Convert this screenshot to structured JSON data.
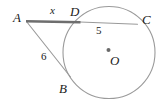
{
  "figure": {
    "kind": "geometry-diagram",
    "background_color": "#ffffff",
    "stroke_color": "#8c8c8c",
    "emphasis_stroke_color": "#6e6e6e",
    "label_color": "#1b1b1b"
  },
  "circle": {
    "center_label": "O",
    "center_x": 109,
    "center_y": 52.5,
    "radius": 46,
    "center_dot_radius": 2.0
  },
  "points": [
    {
      "name": "A",
      "label": "A",
      "x": 26,
      "y": 21,
      "position": "external-left"
    },
    {
      "name": "D",
      "label": "D",
      "x": 80,
      "y": 22,
      "position": "on-circle-top-left"
    },
    {
      "name": "C",
      "label": "C",
      "x": 137,
      "y": 24,
      "position": "on-circle-top-right"
    },
    {
      "name": "B",
      "label": "B",
      "x": 70,
      "y": 76,
      "position": "on-circle-lower-left"
    },
    {
      "name": "O",
      "label": "O",
      "x": 109,
      "y": 52.5,
      "position": "center"
    }
  ],
  "segments": [
    {
      "name": "AD",
      "label": "x",
      "from": "A",
      "to": "D",
      "emphasis": true,
      "style": "thick"
    },
    {
      "name": "DC",
      "label": "5",
      "from": "D",
      "to": "C",
      "emphasis": false,
      "style": "thin"
    },
    {
      "name": "AB",
      "label": "6",
      "from": "A",
      "to": "B",
      "emphasis": false,
      "style": "thin"
    }
  ],
  "labels": {
    "vertex_A": "A",
    "vertex_B": "B",
    "vertex_C": "C",
    "vertex_D": "D",
    "center_O": "O",
    "measure_AD": "x",
    "measure_DC": "5",
    "measure_AB": "6"
  }
}
